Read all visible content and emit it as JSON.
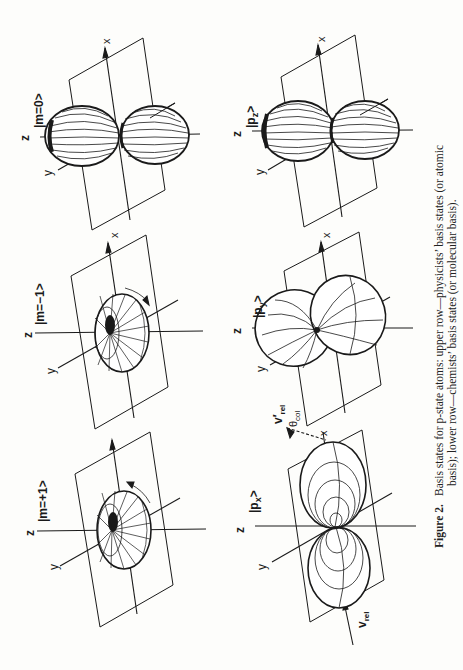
{
  "figure": {
    "number_label": "Figure 2.",
    "caption_line1": "Basis states for p-state atoms: upper row—physicists’ basis states (or atomic",
    "caption_line2": "basis); lower row—chemists’ basis states (or molecular basis).",
    "orientation": "rotated 90° counter-clockwise (landscape figure on portrait page)"
  },
  "rows": {
    "upper": {
      "name": "physicists' basis states",
      "panels": [
        {
          "id": "m_plus_1",
          "ket": "|m=+1>",
          "shape": "torus",
          "rotation_arrow": "counter-clockwise"
        },
        {
          "id": "m_minus_1",
          "ket": "|m=−1>",
          "shape": "torus",
          "rotation_arrow": "clockwise"
        },
        {
          "id": "m_0",
          "ket": "|m=0>",
          "shape": "dumbbell along z"
        }
      ]
    },
    "lower": {
      "name": "chemists' basis states",
      "panels": [
        {
          "id": "p_x",
          "ket": "|p",
          "ket_sub": "x",
          "ket_end": ">",
          "shape": "dumbbell along x",
          "extra_labels": {
            "v_rel": "v",
            "v_rel_sub": "rel",
            "v_rel_prime": "v′",
            "theta_col": "θ",
            "theta_col_sub": "col"
          }
        },
        {
          "id": "p_y",
          "ket": "|p",
          "ket_sub": "y",
          "ket_end": ">",
          "shape": "dumbbell along y"
        },
        {
          "id": "p_z",
          "ket": "|p",
          "ket_sub": "z",
          "ket_end": ">",
          "shape": "dumbbell along z"
        }
      ]
    }
  },
  "axes_labels": {
    "x": "x",
    "y": "y",
    "z": "z"
  }
}
